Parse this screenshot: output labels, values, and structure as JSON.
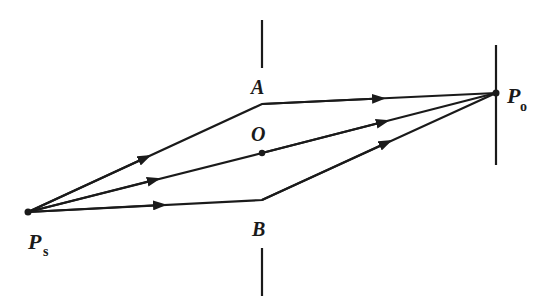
{
  "figure": {
    "stroke_color": "#1a1a1a",
    "background": "#ffffff"
  },
  "points": {
    "Ps": {
      "label": "P",
      "subscript": "s",
      "x": 28,
      "y": 212
    },
    "A": {
      "label": "A",
      "x": 262,
      "y": 104
    },
    "O": {
      "label": "O",
      "x": 262,
      "y": 153
    },
    "B": {
      "label": "B",
      "x": 262,
      "y": 200
    },
    "Po": {
      "label": "P",
      "subscript": "o",
      "x": 496,
      "y": 93
    }
  },
  "barrier": {
    "x": 262,
    "upper_segment": {
      "y1": 20,
      "y2": 68
    },
    "lower_segment": {
      "y1": 248,
      "y2": 296
    }
  },
  "screen": {
    "x": 496,
    "y1": 45,
    "y2": 165
  },
  "rays": [
    {
      "name": "upper-path",
      "via": "A"
    },
    {
      "name": "middle-path",
      "via": "O"
    },
    {
      "name": "lower-path",
      "via": "B"
    }
  ]
}
